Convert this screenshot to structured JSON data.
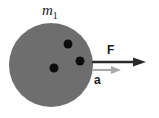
{
  "diagram": {
    "mass": {
      "symbol": "m",
      "subscript": "1",
      "color": "#6e6e6e"
    },
    "ball": {
      "cx": 51,
      "cy": 65,
      "r": 42
    },
    "holes": [
      {
        "cx": 68,
        "cy": 44,
        "r": 4.5
      },
      {
        "cx": 80,
        "cy": 61,
        "r": 4.5
      },
      {
        "cx": 54,
        "cy": 68,
        "r": 4.5
      }
    ],
    "force": {
      "label": "F",
      "color": "#2a2a2a"
    },
    "acceleration": {
      "label": "a",
      "color": "#a8a8a8"
    }
  }
}
